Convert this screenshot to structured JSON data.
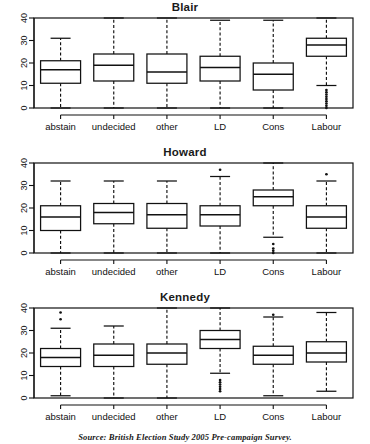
{
  "figure": {
    "caption": "Source: British Election Study 2005 Pre-campaign Survey.",
    "panel_titles": [
      "Blair",
      "Howard",
      "Kennedy"
    ]
  },
  "chart_data": {
    "type": "box",
    "xlabel": "",
    "ylabel": "",
    "ylim": [
      0,
      40
    ],
    "yticks": [
      0,
      10,
      20,
      30,
      40
    ],
    "ytick_labels": [
      "0",
      "10",
      "20",
      "30",
      "40"
    ],
    "grid": false,
    "legend": null,
    "categories": [
      "abstain",
      "undecided",
      "other",
      "LD",
      "Cons",
      "Labour"
    ],
    "panels": [
      {
        "title": "Blair",
        "boxes": [
          {
            "category": "abstain",
            "whisker_low": 0,
            "q1": 11,
            "median": 17,
            "q3": 21,
            "whisker_high": 31,
            "outliers": []
          },
          {
            "category": "undecided",
            "whisker_low": 0,
            "q1": 12,
            "median": 19,
            "q3": 24,
            "whisker_high": 40,
            "outliers": []
          },
          {
            "category": "other",
            "whisker_low": 0,
            "q1": 11,
            "median": 16,
            "q3": 24,
            "whisker_high": 40,
            "outliers": []
          },
          {
            "category": "LD",
            "whisker_low": 0,
            "q1": 12,
            "median": 18,
            "q3": 23,
            "whisker_high": 39,
            "outliers": []
          },
          {
            "category": "Cons",
            "whisker_low": 0,
            "q1": 8,
            "median": 15,
            "q3": 20,
            "whisker_high": 39,
            "outliers": []
          },
          {
            "category": "Labour",
            "whisker_low": 10,
            "q1": 23,
            "median": 28,
            "q3": 31,
            "whisker_high": 40,
            "outliers": [
              8,
              7,
              6,
              5,
              4,
              3,
              2,
              1,
              0
            ]
          }
        ]
      },
      {
        "title": "Howard",
        "boxes": [
          {
            "category": "abstain",
            "whisker_low": 0,
            "q1": 10,
            "median": 16,
            "q3": 21,
            "whisker_high": 32,
            "outliers": []
          },
          {
            "category": "undecided",
            "whisker_low": 0,
            "q1": 13,
            "median": 18,
            "q3": 22,
            "whisker_high": 32,
            "outliers": []
          },
          {
            "category": "other",
            "whisker_low": 0,
            "q1": 11,
            "median": 17,
            "q3": 22,
            "whisker_high": 32,
            "outliers": []
          },
          {
            "category": "LD",
            "whisker_low": 0,
            "q1": 12,
            "median": 17,
            "q3": 21,
            "whisker_high": 34,
            "outliers": [
              37
            ]
          },
          {
            "category": "Cons",
            "whisker_low": 7,
            "q1": 21,
            "median": 25,
            "q3": 28,
            "whisker_high": 40,
            "outliers": [
              4,
              2,
              1,
              0
            ]
          },
          {
            "category": "Labour",
            "whisker_low": 0,
            "q1": 11,
            "median": 16,
            "q3": 21,
            "whisker_high": 32,
            "outliers": [
              35
            ]
          }
        ]
      },
      {
        "title": "Kennedy",
        "boxes": [
          {
            "category": "abstain",
            "whisker_low": 1,
            "q1": 14,
            "median": 18,
            "q3": 22,
            "whisker_high": 31,
            "outliers": [
              35,
              38
            ]
          },
          {
            "category": "undecided",
            "whisker_low": 0,
            "q1": 14,
            "median": 19,
            "q3": 24,
            "whisker_high": 32,
            "outliers": []
          },
          {
            "category": "other",
            "whisker_low": 0,
            "q1": 15,
            "median": 20,
            "q3": 24,
            "whisker_high": 40,
            "outliers": []
          },
          {
            "category": "LD",
            "whisker_low": 11,
            "q1": 22,
            "median": 26,
            "q3": 30,
            "whisker_high": 40,
            "outliers": [
              8,
              7,
              6,
              5,
              4,
              3
            ]
          },
          {
            "category": "Cons",
            "whisker_low": 1,
            "q1": 15,
            "median": 19,
            "q3": 23,
            "whisker_high": 36,
            "outliers": [
              37
            ]
          },
          {
            "category": "Labour",
            "whisker_low": 3,
            "q1": 16,
            "median": 20,
            "q3": 25,
            "whisker_high": 38,
            "outliers": []
          }
        ]
      }
    ]
  }
}
